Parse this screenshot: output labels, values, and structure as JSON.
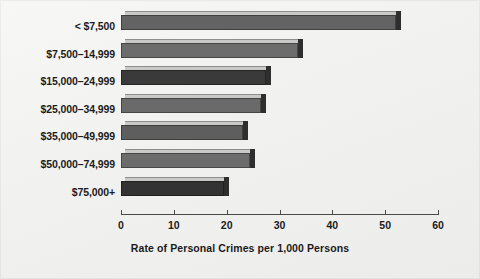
{
  "chart_data": {
    "type": "bar",
    "orientation": "horizontal",
    "title": "",
    "xlabel": "Rate of Personal Crimes per 1,000 Persons",
    "ylabel": "",
    "xlim": [
      0,
      60
    ],
    "xticks": [
      "0",
      "10",
      "20",
      "30",
      "40",
      "50",
      "60"
    ],
    "grid": false,
    "legend": null,
    "categories": [
      "< $7,500",
      "$7,500–14,999",
      "$15,000–24,999",
      "$25,000–34,999",
      "$35,000–49,999",
      "$50,000–74,999",
      "$75,000+"
    ],
    "values": [
      52.0,
      33.5,
      27.5,
      26.5,
      23.0,
      24.5,
      19.5
    ],
    "bar_colors": [
      "#636363",
      "#6c6c6c",
      "#3a3a3a",
      "#6a6a6a",
      "#5e5e5e",
      "#6c6c6c",
      "#333333"
    ]
  },
  "figure": {
    "background_color": "#f1f1ef",
    "axis_color": "#4a4a4a",
    "text_color": "#1b1b1b"
  }
}
